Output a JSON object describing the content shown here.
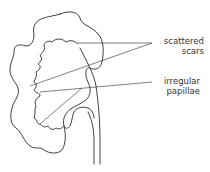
{
  "diagram": {
    "labels": [
      {
        "id": "scattered-scars",
        "line1": "scattered",
        "line2": "scars"
      },
      {
        "id": "irregular-papillae",
        "line1": "irregular",
        "line2": "papillae"
      }
    ],
    "colors": {
      "stroke": "#2a2a2a",
      "text": "#333333",
      "background": "#ffffff"
    }
  }
}
